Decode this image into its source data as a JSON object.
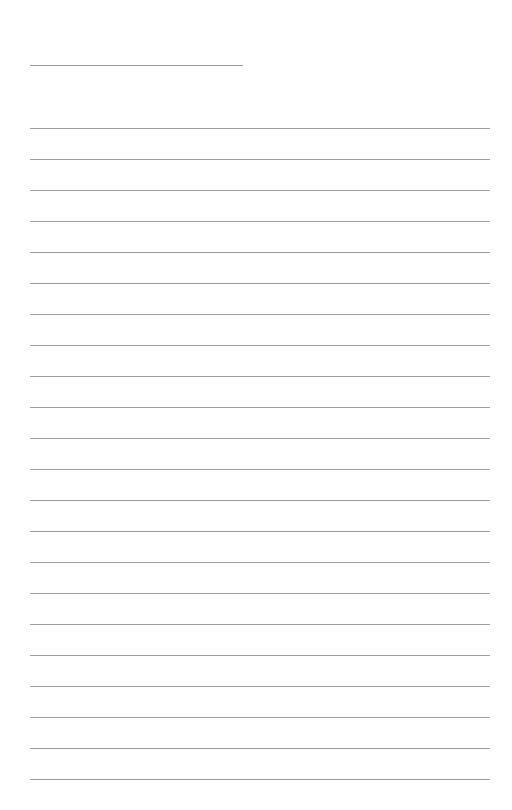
{
  "page": {
    "type": "lined-paper",
    "title_line": {
      "x": 30,
      "y": 65,
      "width": 213
    },
    "rules": {
      "count": 22,
      "start_y": 128,
      "spacing": 31,
      "x": 30,
      "width": 460,
      "color": "#9c9c9c"
    },
    "background": "#ffffff"
  }
}
